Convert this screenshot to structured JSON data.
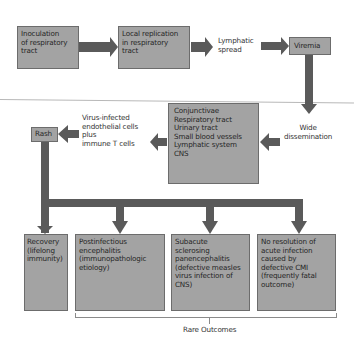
{
  "diagram": {
    "colors": {
      "box_fill": "#a3a3a3",
      "box_border": "#6c6c6c",
      "arrow": "#5a5a5a",
      "divider": "#b8b8b8",
      "bracket": "#8a8a8a"
    },
    "nodes": {
      "inoculation": {
        "lines": [
          "Inoculation",
          "of respiratory",
          "tract"
        ]
      },
      "local_replication": {
        "lines": [
          "Local replication",
          "in respiratory",
          "tract"
        ]
      },
      "lymphatic_spread": {
        "lines": [
          "Lymphatic",
          "spread"
        ]
      },
      "viremia": {
        "lines": [
          "Viremia"
        ]
      },
      "wide_dissemination": {
        "lines": [
          "Wide",
          "dissemination"
        ]
      },
      "sites": {
        "lines": [
          "Conjunctivae",
          "Respiratory tract",
          "Urinary tract",
          "Small blood vessels",
          "Lymphatic system",
          "CNS"
        ]
      },
      "virus_infected_cells": {
        "lines": [
          "Virus-infected",
          "endothelial cells",
          "plus",
          "immune T cells"
        ]
      },
      "rash": {
        "lines": [
          "Rash"
        ]
      },
      "recovery": {
        "lines": [
          "Recovery",
          "(lifelong",
          "immunity)"
        ]
      },
      "postinfectious_encephalitis": {
        "lines": [
          "Postinfectious",
          "encephalitis",
          "(immunopathologic",
          "etiology)"
        ]
      },
      "sspe": {
        "lines": [
          "Subacute",
          "sclerosing",
          "panencephalitis",
          "(defective measles",
          "virus infection of",
          "CNS)"
        ]
      },
      "no_resolution": {
        "lines": [
          "No resolution of",
          "acute infection",
          "caused by",
          "defective CMI",
          "(frequently fatal",
          "outcome)"
        ]
      }
    },
    "bracket_label": "Rare Outcomes",
    "edges": [
      [
        "inoculation",
        "local_replication"
      ],
      [
        "local_replication",
        "lymphatic_spread"
      ],
      [
        "lymphatic_spread",
        "viremia"
      ],
      [
        "viremia",
        "wide_dissemination"
      ],
      [
        "wide_dissemination",
        "sites"
      ],
      [
        "sites",
        "virus_infected_cells"
      ],
      [
        "virus_infected_cells",
        "rash"
      ],
      [
        "rash",
        "recovery"
      ],
      [
        "rash",
        "postinfectious_encephalitis"
      ],
      [
        "rash",
        "sspe"
      ],
      [
        "rash",
        "no_resolution"
      ]
    ]
  }
}
